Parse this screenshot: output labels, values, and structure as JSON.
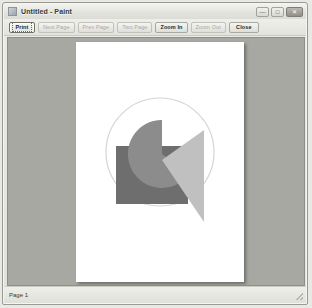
{
  "window": {
    "title": "Untitled - Paint",
    "icon": "paint-app-icon",
    "controls": [
      {
        "name": "minimize",
        "glyph": "—"
      },
      {
        "name": "maximize",
        "glyph": "□"
      },
      {
        "name": "close",
        "glyph": "✕"
      }
    ]
  },
  "toolbar": {
    "buttons": [
      {
        "label": "Print",
        "state": "focused"
      },
      {
        "label": "Next Page",
        "state": "disabled"
      },
      {
        "label": "Prev Page",
        "state": "disabled"
      },
      {
        "label": "Two Page",
        "state": "disabled"
      },
      {
        "label": "Zoom In",
        "state": "enabled"
      },
      {
        "label": "Zoom Out",
        "state": "disabled"
      },
      {
        "label": "Close",
        "state": "enabled"
      }
    ]
  },
  "preview": {
    "background_color": "#a8a8a2",
    "page_color": "#ffffff",
    "artwork": {
      "circle_outline_color": "#d5d5d5",
      "rectangle_color": "#6e6e6e",
      "pacman_color": "#8c8c8c",
      "triangle_color": "#c0c0c0"
    }
  },
  "statusbar": {
    "page_label": "Page 1"
  }
}
